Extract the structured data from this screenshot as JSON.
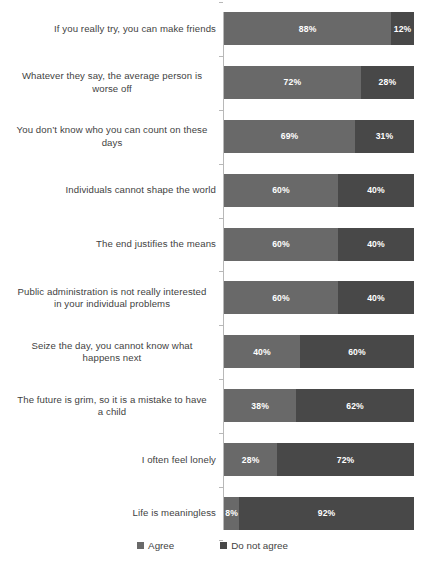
{
  "chart_data": {
    "type": "bar",
    "subtype": "stacked-horizontal-100",
    "title": "",
    "xlabel": "",
    "ylabel": "",
    "xlim": [
      0,
      100
    ],
    "grid": false,
    "legend_position": "bottom-center",
    "categories": [
      "If you really try, you can make friends",
      "Whatever they say, the average person is worse off",
      "You don’t know who you can count on these days",
      "Individuals cannot shape the world",
      "The end justifies the means",
      "Public administration is not really interested in your individual problems",
      "Seize the day, you cannot know what happens next",
      "The future is grim, so it is a mistake to have a child",
      "I often feel lonely",
      "Life is meaningless"
    ],
    "category_lines": [
      [
        "If you really try, you can make friends"
      ],
      [
        "Whatever they say, the average person is",
        "worse off"
      ],
      [
        "You don’t know who you can count on these",
        "days"
      ],
      [
        "Individuals cannot shape the world"
      ],
      [
        "The end justifies the means"
      ],
      [
        "Public administration is not really interested",
        "in your individual problems"
      ],
      [
        "Seize the day, you cannot know what",
        "happens next"
      ],
      [
        "The future is grim, so it is a mistake to have",
        "a child"
      ],
      [
        "I often feel lonely"
      ],
      [
        "Life is meaningless"
      ]
    ],
    "series": [
      {
        "name": "Agree",
        "color": "#696969",
        "values": [
          88,
          72,
          69,
          60,
          60,
          60,
          40,
          38,
          28,
          8
        ],
        "labels": [
          "88%",
          "72%",
          "69%",
          "60%",
          "60%",
          "60%",
          "40%",
          "38%",
          "28%",
          "8%"
        ]
      },
      {
        "name": "Do not agree",
        "color": "#484848",
        "values": [
          12,
          28,
          31,
          40,
          40,
          40,
          60,
          62,
          72,
          92
        ],
        "labels": [
          "12%",
          "28%",
          "31%",
          "40%",
          "40%",
          "40%",
          "60%",
          "62%",
          "72%",
          "92%"
        ]
      }
    ],
    "legend": [
      {
        "label": "Agree",
        "color": "#696969"
      },
      {
        "label": "Do not agree",
        "color": "#484848"
      }
    ]
  }
}
